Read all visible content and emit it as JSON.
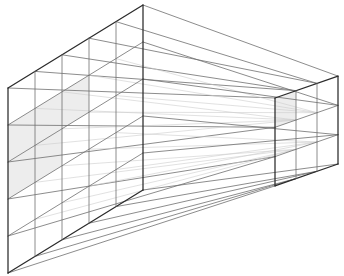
{
  "figure": {
    "title": "",
    "type": "geometric-line-diagram",
    "background_color": "#ffffff",
    "canvas": {
      "width": 344,
      "height": 276
    }
  },
  "style": {
    "stroke_dark": "#2b2b2b",
    "stroke_mid": "#6e6e6e",
    "stroke_light": "#a8a8a8",
    "stroke_faint": "#cccccc",
    "shade_fill": "#ededed",
    "shade_fill_soft": "#f4f4f4",
    "stroke_width_thick": 1.25,
    "stroke_width_thin": 0.8
  },
  "near_plane": {
    "name": "near-grid-plane",
    "columns": 5,
    "rows": 5,
    "corners": {
      "top_left": [
        8,
        88
      ],
      "top_right": [
        143,
        5
      ],
      "bottom_right": [
        143,
        190
      ],
      "bottom_left": [
        8,
        273
      ]
    },
    "column_x": [
      8,
      35,
      62,
      89,
      116,
      143
    ],
    "shear_dy_per_column": -16.6,
    "row_height": 37,
    "shaded_cells": [
      [
        0,
        1
      ],
      [
        1,
        1
      ],
      [
        2,
        1
      ],
      [
        0,
        2
      ],
      [
        1,
        2
      ]
    ]
  },
  "far_plane": {
    "name": "far-grid-plane",
    "columns": 3,
    "rows": 3,
    "corners": {
      "top_left": [
        275,
        98
      ],
      "top_right": [
        338,
        76
      ],
      "bottom_right": [
        338,
        164
      ],
      "bottom_left": [
        275,
        186
      ]
    },
    "column_x": [
      275,
      296,
      317,
      338
    ],
    "shear_dy_per_column": -7.3,
    "row_height": 29.3,
    "shaded_cells": [
      [
        0,
        0
      ]
    ]
  },
  "projection_rays": {
    "name": "projection-rays",
    "count": 24,
    "description": "lines joining near-plane grid nodes to far-plane grid nodes"
  },
  "labels": []
}
